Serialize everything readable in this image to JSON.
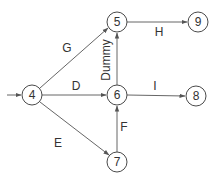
{
  "diagram": {
    "type": "activity-network",
    "nodes": [
      {
        "id": "4",
        "label": "4",
        "x": 32,
        "y": 95
      },
      {
        "id": "5",
        "label": "5",
        "x": 117,
        "y": 22
      },
      {
        "id": "9",
        "label": "9",
        "x": 198,
        "y": 22
      },
      {
        "id": "6",
        "label": "6",
        "x": 117,
        "y": 95
      },
      {
        "id": "8",
        "label": "8",
        "x": 196,
        "y": 96
      },
      {
        "id": "7",
        "label": "7",
        "x": 117,
        "y": 162
      }
    ],
    "edges": [
      {
        "from": "start",
        "to": "4",
        "label": ""
      },
      {
        "from": "4",
        "to": "5",
        "label": "G"
      },
      {
        "from": "5",
        "to": "9",
        "label": "H"
      },
      {
        "from": "4",
        "to": "6",
        "label": "D"
      },
      {
        "from": "6",
        "to": "8",
        "label": "I"
      },
      {
        "from": "4",
        "to": "7",
        "label": "E"
      },
      {
        "from": "7",
        "to": "6",
        "label": "F"
      },
      {
        "from": "6",
        "to": "5",
        "label": "Dummy"
      }
    ],
    "labels": {
      "G": "G",
      "H": "H",
      "D": "D",
      "I": "I",
      "E": "E",
      "F": "F",
      "dummy": "Dummy"
    },
    "colors": {
      "stroke": "#555555",
      "text": "#333333",
      "background": "#ffffff"
    }
  }
}
